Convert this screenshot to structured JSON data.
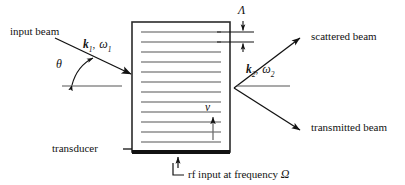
{
  "figure": {
    "background_color": "#ffffff",
    "ink_color": "#121212",
    "wavefront_color": "#8c8c8c",
    "width": 405,
    "height": 185
  },
  "labels": {
    "input_beam": "input beam",
    "scattered_beam": "scattered beam",
    "transmitted_beam": "transmitted beam",
    "transducer": "transducer",
    "transducer_dash": "—",
    "rf_input": "rf input at frequency",
    "rf_symbol": "Ω",
    "theta": "θ",
    "lambda": "Λ",
    "velocity": "v",
    "k1_vector": "k",
    "k1_sub": "1",
    "k1_comma": ",",
    "omega1": "ω",
    "omega1_sub": "1",
    "k2_vector": "k",
    "k2_sub": "2",
    "k2_comma": ",",
    "omega2": "ω",
    "omega2_sub": "2"
  },
  "cell": {
    "x": 132,
    "y": 22,
    "width": 98,
    "height": 130,
    "wavefront_count": 12,
    "transducer_bar_thickness": 4
  },
  "beams": {
    "input": {
      "x1": 55,
      "y1": 38,
      "x2": 131,
      "y2": 74,
      "direction": "down-right"
    },
    "scattered": {
      "x1": 234,
      "y1": 88,
      "x2": 300,
      "y2": 38,
      "direction": "up-right"
    },
    "transmitted": {
      "x1": 234,
      "y1": 88,
      "x2": 300,
      "y2": 130,
      "direction": "down-right"
    }
  },
  "annotations": {
    "theta_arc": "double-headed arc between horizontal reference and input beam",
    "lambda_marker": "vertical double arrow spanning one acoustic period",
    "velocity_arrow": "upward arrow showing acoustic wave travel",
    "rf_arrow": "upward arrow into transducer"
  }
}
